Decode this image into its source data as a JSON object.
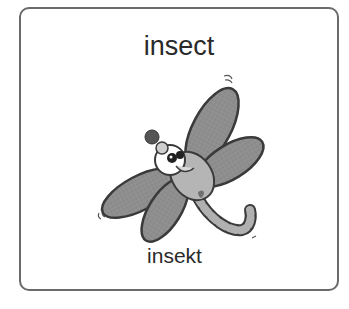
{
  "card": {
    "title": "insect",
    "subtitle": "insekt",
    "image": {
      "subject": "dragonfly-illustration",
      "style": "grayscale cartoon"
    }
  },
  "colors": {
    "border": "#6a6a6a",
    "text": "#2a2a2a",
    "wing_fill": "#8c8c8c",
    "wing_outline": "#3a3a3a",
    "body_fill": "#b8b8b8"
  }
}
